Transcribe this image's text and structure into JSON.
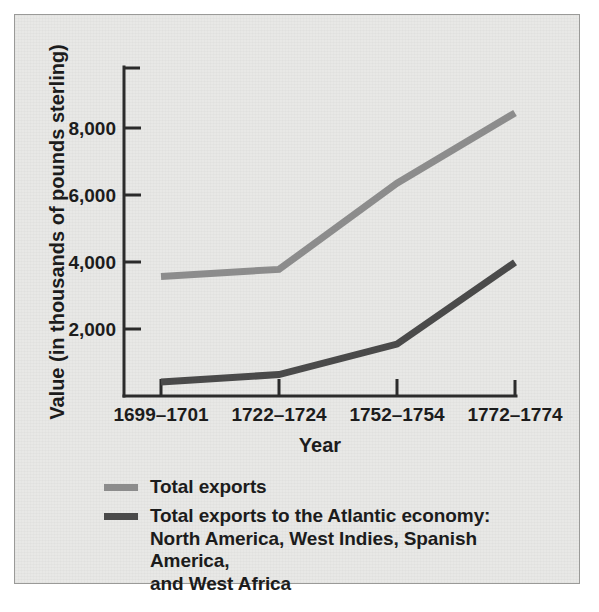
{
  "chart_data": {
    "type": "line",
    "title": "",
    "xlabel": "Year",
    "ylabel": "Value (in thousands of pounds sterling)",
    "categories": [
      "1699–1701",
      "1722–1724",
      "1752–1754",
      "1772–1774"
    ],
    "ytick_labels": [
      "2,000",
      "4,000",
      "6,000",
      "8,000"
    ],
    "ytick_values": [
      2000,
      4000,
      6000,
      8000
    ],
    "ylim": [
      0,
      9200
    ],
    "grid": false,
    "legend_position": "below-plot",
    "series": [
      {
        "name": "Total exports",
        "color": "#8c8c8c",
        "values": [
          3570,
          3780,
          6350,
          8450
        ]
      },
      {
        "name": "Total exports to the Atlantic economy: North America, West Indies, Spanish America, and West Africa",
        "color": "#4a4a4a",
        "values": [
          420,
          640,
          1550,
          3990
        ]
      }
    ]
  },
  "legend": {
    "items": [
      {
        "label": "Total exports",
        "color": "#8c8c8c"
      },
      {
        "label": "Total exports to the Atlantic economy:\nNorth America, West Indies, Spanish America,\nand West Africa",
        "color": "#4a4a4a"
      }
    ]
  },
  "axes": {
    "y_title": "Value (in thousands of pounds sterling)",
    "x_title": "Year"
  }
}
